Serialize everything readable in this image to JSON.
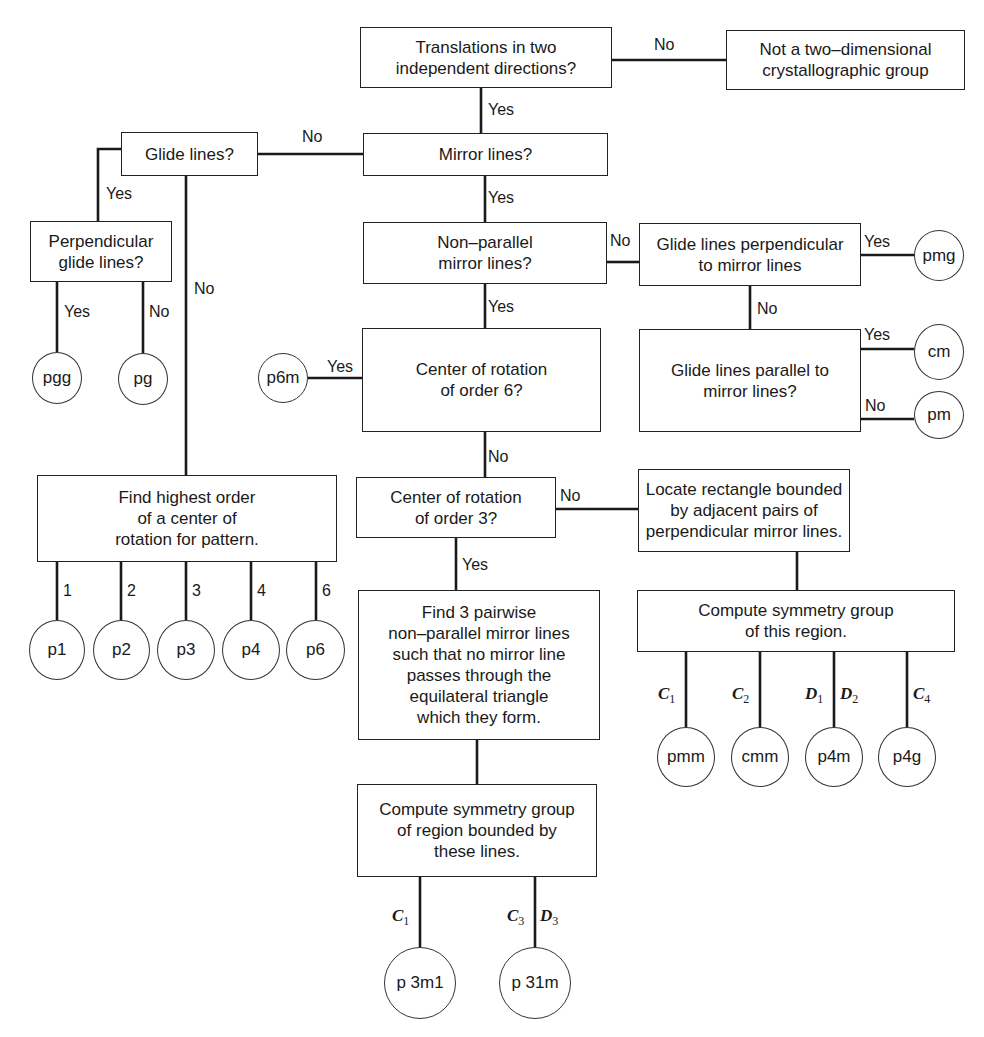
{
  "nodes": {
    "translations": "Translations in two\nindependent directions?",
    "not_crystallographic": "Not a two–dimensional\ncrystallographic group",
    "mirror_lines": "Mirror lines?",
    "glide_lines": "Glide lines?",
    "perpendicular_glide": "Perpendicular\nglide lines?",
    "non_parallel_mirror": "Non–parallel\nmirror lines?",
    "glide_perp_mirror": "Glide lines perpendicular\nto mirror lines",
    "glide_parallel_mirror": "Glide lines parallel to\nmirror lines?",
    "order6": "Center of rotation\nof order 6?",
    "highest_order": "Find highest order\nof a center of\nrotation for pattern.",
    "order3": "Center of rotation\nof order 3?",
    "locate_rectangle": "Locate rectangle bounded\nby adjacent pairs of\nperpendicular mirror lines.",
    "find3": "Find 3 pairwise\nnon–parallel mirror lines\nsuch that no mirror line\npasses through the\nequilateral triangle\nwhich they form.",
    "compute_region": "Compute symmetry group\nof this region.",
    "compute_bounded": "Compute symmetry group\nof region bounded by\nthese lines."
  },
  "groups": {
    "pmg": "pmg",
    "cm": "cm",
    "pm": "pm",
    "pgg": "pgg",
    "pg": "pg",
    "p6m": "p6m",
    "p1": "p1",
    "p2": "p2",
    "p3": "p3",
    "p4": "p4",
    "p6": "p6",
    "pmm": "pmm",
    "cmm": "cmm",
    "p4m": "p4m",
    "p4g": "p4g",
    "p3m1": "p 3m1",
    "p31m": "p 31m"
  },
  "edge_labels": {
    "yes": "Yes",
    "no": "No",
    "orders": [
      "1",
      "2",
      "3",
      "4",
      "6"
    ]
  },
  "math_labels": {
    "C": "C",
    "D": "D",
    "sub1": "1",
    "sub2": "2",
    "sub3": "3",
    "sub4": "4"
  }
}
